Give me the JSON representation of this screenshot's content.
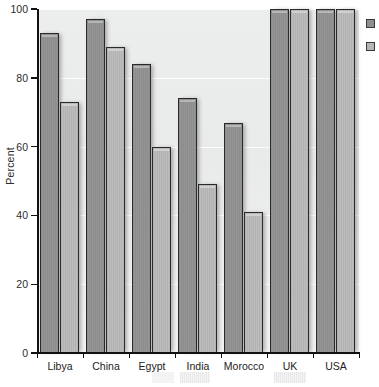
{
  "chart_data": {
    "type": "bar",
    "title": "",
    "xlabel": "",
    "ylabel": "Percent",
    "ylim": [
      0,
      100
    ],
    "yticks": [
      0,
      20,
      40,
      60,
      80,
      100
    ],
    "grid": true,
    "legend_position": "right",
    "categories": [
      "Libya",
      "China",
      "Egypt",
      "India",
      "Morocco",
      "UK",
      "USA"
    ],
    "series": [
      {
        "name": "",
        "color": "#8f8f8f",
        "values": [
          93,
          97,
          84,
          74,
          67,
          100,
          100
        ]
      },
      {
        "name": "",
        "color": "#b6b6b6",
        "values": [
          73,
          89,
          60,
          49,
          41,
          100,
          100
        ]
      }
    ]
  },
  "axis": {
    "y_title": "Percent",
    "y_tick_labels": [
      "0",
      "20",
      "40",
      "60",
      "80",
      "100"
    ],
    "x_tick_labels": [
      "Libya",
      "China",
      "Egypt",
      "India",
      "Morocco",
      "UK",
      "USA"
    ]
  },
  "legend": {
    "entries": [
      {
        "label": "",
        "color": "#8f8f8f"
      },
      {
        "label": "",
        "color": "#b6b6b6"
      }
    ]
  },
  "colors": {
    "series_1": "#8f8f8f",
    "series_2": "#b6b6b6",
    "plot_background": "#ebecec",
    "axis": "#111111",
    "gridline": "#ffffff"
  }
}
